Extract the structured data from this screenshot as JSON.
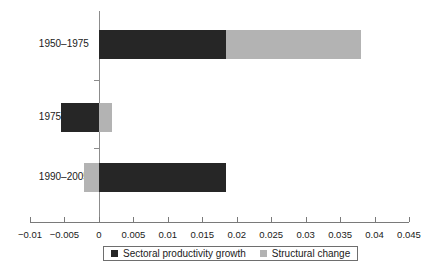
{
  "chart_data": {
    "type": "bar",
    "orientation": "horizontal",
    "stacked": true,
    "title": "",
    "subtitle": "",
    "xlabel": "",
    "ylabel": "",
    "categories": [
      "1950–1975",
      "1975–1990",
      "1990–2005"
    ],
    "series": [
      {
        "name": "Sectoral productivity growth",
        "color": "#262626",
        "values": [
          0.0185,
          -0.0055,
          0.0184
        ]
      },
      {
        "name": "Structural change",
        "color": "#b3b3b3",
        "values": [
          0.0195,
          0.0019,
          -0.0022
        ]
      }
    ],
    "totals": [
      0.038,
      -0.0036,
      0.0162
    ],
    "xlim": [
      -0.01,
      0.045
    ],
    "xticks": [
      -0.01,
      -0.005,
      0,
      0.005,
      0.01,
      0.015,
      0.02,
      0.025,
      0.03,
      0.035,
      0.04,
      0.045
    ],
    "xtick_labels": [
      "−0.01",
      "−0.005",
      "0",
      "0.005",
      "0.01",
      "0.015",
      "0.02",
      "0.025",
      "0.03",
      "0.035",
      "0.04",
      "0.045"
    ],
    "grid": false,
    "legend_position": "bottom",
    "legend": [
      {
        "label": "Sectoral productivity growth",
        "color": "#262626",
        "swatch": "square-dark-icon"
      },
      {
        "label": "Structural change",
        "color": "#b3b3b3",
        "swatch": "square-light-icon"
      }
    ]
  },
  "style": {
    "axis_color": "#7a7a7a",
    "zero_line_color": "#8c8c8c",
    "text_color": "#1a1a1a",
    "background": "#ffffff"
  }
}
